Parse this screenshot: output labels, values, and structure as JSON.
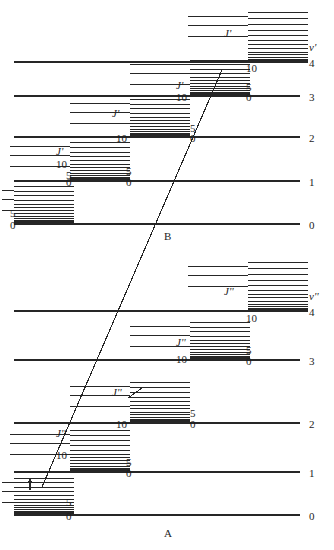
{
  "figure": {
    "title": "",
    "type": "energy-level-diagram",
    "sections": [
      {
        "id": "B",
        "label": "B",
        "label_x": 166,
        "label_y": 232,
        "state_label": "v'",
        "state_label_x": 310,
        "state_label_y": 47
      },
      {
        "id": "A",
        "label": "A",
        "label_x": 166,
        "label_y": 529,
        "state_label": "v''",
        "state_label_x": 310,
        "state_label_y": 295
      }
    ]
  },
  "chart_data": {
    "type": "line",
    "xlabel": "",
    "ylabel": "Energy",
    "grid": false,
    "legend": "none",
    "upper_state": {
      "name": "B",
      "quantum_number_symbol": "v'",
      "rotational_symbol": "J'",
      "vibrational_levels": [
        {
          "v": 4,
          "y": 62,
          "x_start": 14,
          "x_end": 300,
          "J_ladder_x": 248,
          "J_ladder_top": 12,
          "J_labels": []
        },
        {
          "v": 3,
          "y": 96,
          "x_start": 14,
          "x_end": 300,
          "J_ladder_x": 190,
          "J_ladder_top": 60,
          "J_labels": [
            "0",
            "5",
            "10"
          ]
        },
        {
          "v": 2,
          "y": 137,
          "x_start": 14,
          "x_end": 300,
          "J_ladder_x": 130,
          "J_ladder_top": 99,
          "J_labels": [
            "0",
            "5",
            "10"
          ]
        },
        {
          "v": 1,
          "y": 181,
          "x_start": 14,
          "x_end": 300,
          "J_ladder_x": 70,
          "J_ladder_top": 142,
          "J_labels": [
            "0",
            "5",
            "10"
          ]
        },
        {
          "v": 0,
          "y": 224,
          "x_start": 14,
          "x_end": 300,
          "J_ladder_x": 14,
          "J_ladder_top": 186,
          "J_labels": [
            "0",
            "5"
          ]
        }
      ],
      "v_tick_labels": [
        "4",
        "3",
        "2",
        "1",
        "0"
      ]
    },
    "lower_state": {
      "name": "A",
      "quantum_number_symbol": "v''",
      "rotational_symbol": "J''",
      "vibrational_levels": [
        {
          "v": 4,
          "y": 311,
          "x_start": 14,
          "x_end": 300,
          "J_ladder_x": 248,
          "J_ladder_top": 262,
          "J_labels": []
        },
        {
          "v": 3,
          "y": 360,
          "x_start": 14,
          "x_end": 300,
          "J_ladder_x": 190,
          "J_ladder_top": 322,
          "J_labels": [
            "0",
            "5",
            "10"
          ]
        },
        {
          "v": 2,
          "y": 423,
          "x_start": 14,
          "x_end": 300,
          "J_ladder_x": 130,
          "J_ladder_top": 382,
          "J_labels": [
            "0",
            "5",
            "10"
          ]
        },
        {
          "v": 1,
          "y": 472,
          "x_start": 14,
          "x_end": 300,
          "J_ladder_x": 70,
          "J_ladder_top": 430,
          "J_labels": [
            "0",
            "5",
            "10"
          ]
        },
        {
          "v": 0,
          "y": 515,
          "x_start": 14,
          "x_end": 300,
          "J_ladder_x": 14,
          "J_ladder_top": 478,
          "J_labels": [
            "0",
            "5"
          ]
        }
      ],
      "v_tick_labels": [
        "4",
        "3",
        "2",
        "1",
        "0"
      ]
    },
    "transition_line": {
      "name": "electronic-transition",
      "x1": 42,
      "y1": 487,
      "x2": 222,
      "y2": 70,
      "description": "diagonal transition line from lower state A to upper state B"
    },
    "annotations": [
      {
        "name": "small-arrow",
        "x": 30,
        "y": 478,
        "height": 12,
        "description": "small vertical arrow between two rotational levels"
      },
      {
        "name": "short-diagonal-mark",
        "x": 128,
        "y": 388,
        "description": "short diagonal tick inside v''=2 rotational ladder"
      }
    ]
  },
  "labels": {
    "upper": {
      "v_symbol": "v'",
      "J_symbol": "J'",
      "vibrational_numbers": [
        "4",
        "3",
        "2",
        "1",
        "0"
      ],
      "rot_numbers": [
        "0",
        "5",
        "10"
      ],
      "section_name": "B"
    },
    "lower": {
      "v_symbol": "v''",
      "J_symbol": "J''",
      "vibrational_numbers": [
        "4",
        "3",
        "2",
        "1",
        "0"
      ],
      "rot_numbers": [
        "0",
        "5",
        "10"
      ],
      "section_name": "A"
    }
  },
  "text_items": [
    {
      "id": "up_v_sym",
      "text": "v'",
      "x": 309,
      "y": 42,
      "italic": true
    },
    {
      "id": "up_v4",
      "text": "4",
      "x": 309,
      "y": 58,
      "italic": false
    },
    {
      "id": "up_v3",
      "text": "3",
      "x": 309,
      "y": 92,
      "italic": false
    },
    {
      "id": "up_v2",
      "text": "2",
      "x": 309,
      "y": 133,
      "italic": false
    },
    {
      "id": "up_v1",
      "text": "1",
      "x": 309,
      "y": 177,
      "italic": false
    },
    {
      "id": "up_v0",
      "text": "0",
      "x": 309,
      "y": 220,
      "italic": false
    },
    {
      "id": "up_J4",
      "text": "J'",
      "x": 224,
      "y": 28,
      "italic": true
    },
    {
      "id": "up_J3",
      "text": "J'",
      "x": 176,
      "y": 80,
      "italic": true
    },
    {
      "id": "up_J2",
      "text": "J'",
      "x": 112,
      "y": 108,
      "italic": true
    },
    {
      "id": "up_J1",
      "text": "J'",
      "x": 56,
      "y": 146,
      "italic": true
    },
    {
      "id": "up_n4_10",
      "text": "10",
      "x": 246,
      "y": 63,
      "italic": false
    },
    {
      "id": "up_n4_5",
      "text": "5",
      "x": 246,
      "y": 82,
      "italic": false
    },
    {
      "id": "up_n4_0",
      "text": "0",
      "x": 246,
      "y": 92,
      "italic": false
    },
    {
      "id": "up_n3_10",
      "text": "10",
      "x": 176,
      "y": 92,
      "italic": false
    },
    {
      "id": "up_n3_5",
      "text": "5",
      "x": 190,
      "y": 123,
      "italic": false
    },
    {
      "id": "up_n3_0",
      "text": "0",
      "x": 190,
      "y": 133,
      "italic": false
    },
    {
      "id": "up_n2_10",
      "text": "10",
      "x": 116,
      "y": 133,
      "italic": false
    },
    {
      "id": "up_n2_5",
      "text": "5",
      "x": 126,
      "y": 166,
      "italic": false
    },
    {
      "id": "up_n2_0",
      "text": "0",
      "x": 126,
      "y": 177,
      "italic": false
    },
    {
      "id": "up_n1_10",
      "text": "10",
      "x": 56,
      "y": 159,
      "italic": false
    },
    {
      "id": "up_n1_5",
      "text": "5",
      "x": 66,
      "y": 170,
      "italic": false
    },
    {
      "id": "up_n1_0",
      "text": "0",
      "x": 66,
      "y": 177,
      "italic": false
    },
    {
      "id": "up_n0_5",
      "text": "5",
      "x": 10,
      "y": 208,
      "italic": false
    },
    {
      "id": "up_n0_0",
      "text": "0",
      "x": 10,
      "y": 220,
      "italic": false
    },
    {
      "id": "sect_B",
      "text": "B",
      "x": 164,
      "y": 231,
      "italic": false
    },
    {
      "id": "lo_v_sym",
      "text": "v''",
      "x": 309,
      "y": 291,
      "italic": true
    },
    {
      "id": "lo_v4",
      "text": "4",
      "x": 309,
      "y": 307,
      "italic": false
    },
    {
      "id": "lo_v3",
      "text": "3",
      "x": 309,
      "y": 356,
      "italic": false
    },
    {
      "id": "lo_v2",
      "text": "2",
      "x": 309,
      "y": 419,
      "italic": false
    },
    {
      "id": "lo_v1",
      "text": "1",
      "x": 309,
      "y": 468,
      "italic": false
    },
    {
      "id": "lo_v0",
      "text": "0",
      "x": 309,
      "y": 511,
      "italic": false
    },
    {
      "id": "lo_J4",
      "text": "J''",
      "x": 224,
      "y": 286,
      "italic": true
    },
    {
      "id": "lo_J3",
      "text": "J''",
      "x": 176,
      "y": 337,
      "italic": true
    },
    {
      "id": "lo_J2",
      "text": "J''",
      "x": 112,
      "y": 387,
      "italic": true
    },
    {
      "id": "lo_J1",
      "text": "J''",
      "x": 56,
      "y": 428,
      "italic": true
    },
    {
      "id": "lo_n4_10",
      "text": "10",
      "x": 246,
      "y": 313,
      "italic": false
    },
    {
      "id": "lo_n3_10",
      "text": "10",
      "x": 176,
      "y": 354,
      "italic": false
    },
    {
      "id": "lo_n3_5",
      "text": "5",
      "x": 246,
      "y": 345,
      "italic": false
    },
    {
      "id": "lo_n3_0",
      "text": "0",
      "x": 246,
      "y": 356,
      "italic": false
    },
    {
      "id": "lo_n2_10",
      "text": "10",
      "x": 116,
      "y": 419,
      "italic": false
    },
    {
      "id": "lo_n2_5",
      "text": "5",
      "x": 190,
      "y": 408,
      "italic": false
    },
    {
      "id": "lo_n2_0",
      "text": "0",
      "x": 190,
      "y": 419,
      "italic": false
    },
    {
      "id": "lo_n1_10",
      "text": "10",
      "x": 56,
      "y": 450,
      "italic": false
    },
    {
      "id": "lo_n1_5",
      "text": "5",
      "x": 126,
      "y": 457,
      "italic": false
    },
    {
      "id": "lo_n1_0",
      "text": "0",
      "x": 126,
      "y": 468,
      "italic": false
    },
    {
      "id": "lo_n0_5",
      "text": "5",
      "x": 66,
      "y": 497,
      "italic": false
    },
    {
      "id": "lo_n0_0",
      "text": "0",
      "x": 66,
      "y": 511,
      "italic": false
    },
    {
      "id": "sect_A",
      "text": "A",
      "x": 164,
      "y": 528,
      "italic": false
    }
  ],
  "colors": {
    "ink": "#1a1a1a",
    "background": "#ffffff",
    "line": "#262626"
  }
}
